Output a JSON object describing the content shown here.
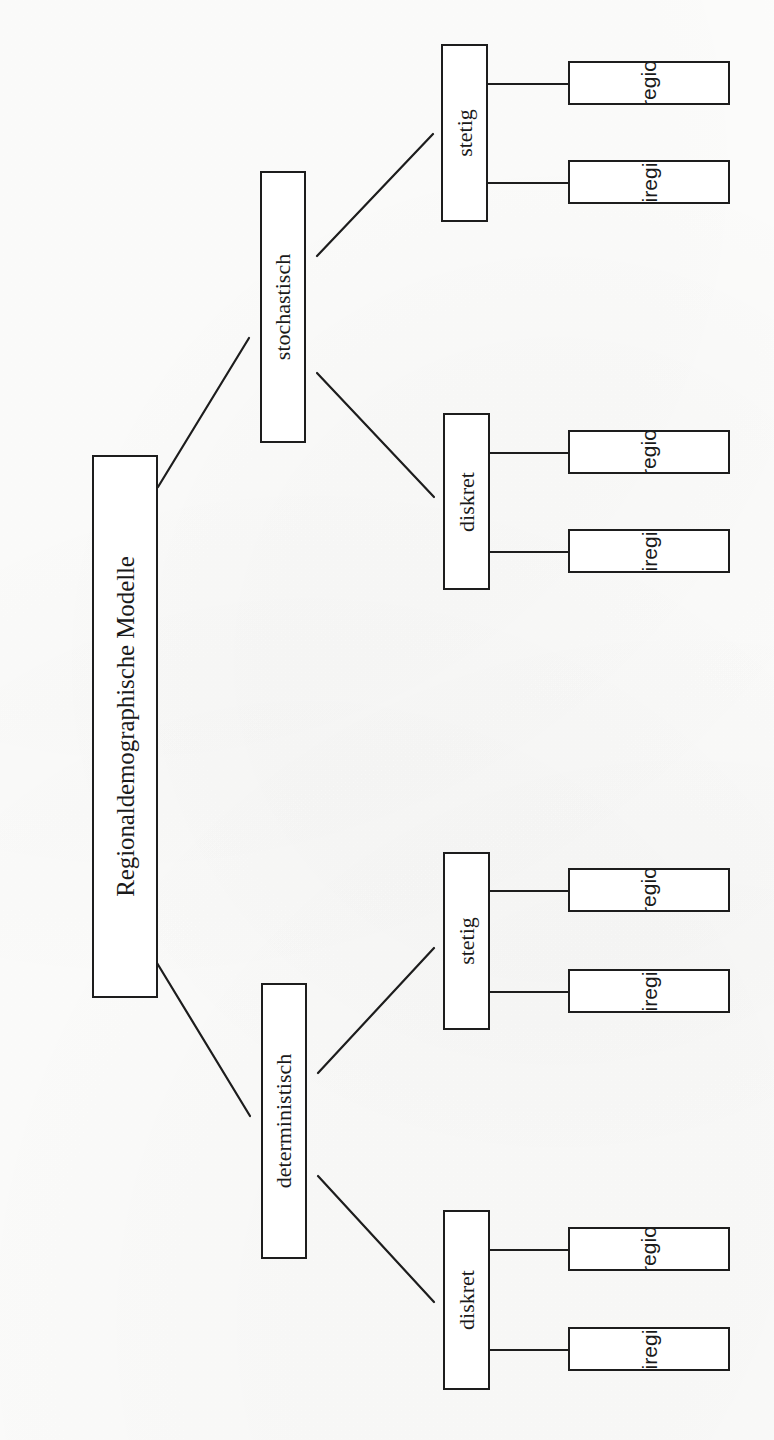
{
  "figure": {
    "type": "tree-diagram",
    "orientation": "rotated-90-ccw",
    "caption": "Abb. 1: Einteilung der regionaldemographischen Modelle",
    "background_color": "#fdfdfc",
    "line_color": "#1d1d1d"
  },
  "tree": {
    "root": {
      "label": "Regionaldemographische Modelle"
    },
    "branches": [
      {
        "label": "stochastisch",
        "children": [
          {
            "label": "stetig",
            "leaves": [
              "einregional",
              "multiregional"
            ]
          },
          {
            "label": "diskret",
            "leaves": [
              "einregional",
              "multiregional"
            ]
          }
        ]
      },
      {
        "label": "deterministisch",
        "children": [
          {
            "label": "stetig",
            "leaves": [
              "einregional",
              "multiregional"
            ]
          },
          {
            "label": "diskret",
            "leaves": [
              "einregional",
              "multiregional"
            ]
          }
        ]
      }
    ]
  },
  "nodes": {
    "root": "Regionaldemographische Modelle",
    "stochastisch": "stochastisch",
    "deterministisch": "deterministisch",
    "stoch_stetig": "stetig",
    "stoch_diskret": "diskret",
    "det_stetig": "stetig",
    "det_diskret": "diskret",
    "leaf1": "einregional",
    "leaf2": "multiregional",
    "leaf3": "einregional",
    "leaf4": "multiregional",
    "leaf5": "einregional",
    "leaf6": "multiregional",
    "leaf7": "einregional",
    "leaf8": "multiregional"
  }
}
